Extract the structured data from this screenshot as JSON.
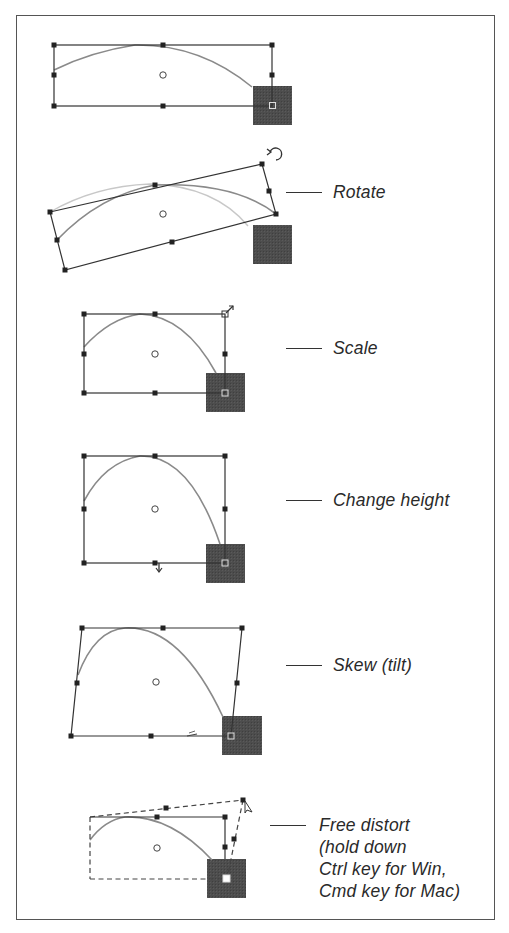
{
  "diagram": {
    "title": "",
    "colors": {
      "frame": "#555555",
      "bbox_line": "#333333",
      "handle": "#222222",
      "curve": "#8a8a8a",
      "ghost_curve": "#c8c8c8",
      "shape_fill": "#4a4a4a",
      "label_text": "#2a2a2a"
    },
    "steps": [
      {
        "id": "original",
        "label": ""
      },
      {
        "id": "rotate",
        "label": "Rotate"
      },
      {
        "id": "scale",
        "label": "Scale"
      },
      {
        "id": "change-height",
        "label": "Change height"
      },
      {
        "id": "skew",
        "label": "Skew (tilt)"
      },
      {
        "id": "free-distort",
        "label_lines": [
          "Free distort",
          "(hold down",
          "Ctrl key for Win,",
          "Cmd key for Mac)"
        ]
      }
    ]
  }
}
